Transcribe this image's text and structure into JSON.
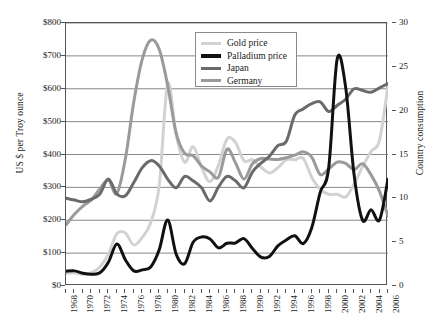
{
  "chart_data": {
    "type": "line",
    "title": "",
    "xlabel": "",
    "ylabel": "US $ per Troy ounce",
    "y2label": "Country consumption",
    "xlim": [
      1968,
      2006
    ],
    "ylim": [
      0,
      800
    ],
    "y2lim": [
      0,
      30
    ],
    "grid": true,
    "legend_position": "top-center",
    "xtick_labels": [
      "1968",
      "1970",
      "1972",
      "1974",
      "1976",
      "1978",
      "1980",
      "1982",
      "1984",
      "1986",
      "1988",
      "1990",
      "1992",
      "1994",
      "1996",
      "1998",
      "2000",
      "2002",
      "2004",
      "2006"
    ],
    "xtick_values": [
      1968,
      1970,
      1972,
      1974,
      1976,
      1978,
      1980,
      1982,
      1984,
      1986,
      1988,
      1990,
      1992,
      1994,
      1996,
      1998,
      2000,
      2002,
      2004,
      2006
    ],
    "ytick_labels": [
      "$0",
      "$100",
      "$200",
      "$300",
      "$400",
      "$500",
      "$600",
      "$700",
      "$800"
    ],
    "ytick_values": [
      0,
      100,
      200,
      300,
      400,
      500,
      600,
      700,
      800
    ],
    "y2tick_labels": [
      "0",
      "5",
      "10",
      "15",
      "20",
      "25",
      "30"
    ],
    "y2tick_values": [
      0,
      5,
      10,
      15,
      20,
      25,
      30
    ],
    "x": [
      1968,
      1969,
      1970,
      1971,
      1972,
      1973,
      1974,
      1975,
      1976,
      1977,
      1978,
      1979,
      1980,
      1981,
      1982,
      1983,
      1984,
      1985,
      1986,
      1987,
      1988,
      1989,
      1990,
      1991,
      1992,
      1993,
      1994,
      1995,
      1996,
      1997,
      1998,
      1999,
      2000,
      2001,
      2002,
      2003,
      2004,
      2005,
      2006
    ],
    "series": [
      {
        "name": "Gold price",
        "axis": "left",
        "unit": "US $ per Troy ounce",
        "color": "#d2d2d2",
        "width": 3.0,
        "values": [
          38,
          40,
          36,
          41,
          58,
          97,
          159,
          161,
          125,
          148,
          193,
          306,
          615,
          460,
          376,
          424,
          361,
          317,
          368,
          447,
          437,
          381,
          384,
          362,
          344,
          360,
          384,
          384,
          388,
          331,
          294,
          279,
          279,
          271,
          310,
          363,
          409,
          444,
          610
        ]
      },
      {
        "name": "Palladium price",
        "axis": "left",
        "unit": "US $ per Troy ounce",
        "color": "#111111",
        "width": 3.0,
        "values": [
          45,
          46,
          39,
          36,
          40,
          72,
          128,
          80,
          46,
          49,
          58,
          110,
          201,
          97,
          68,
          133,
          149,
          143,
          116,
          130,
          131,
          144,
          114,
          88,
          90,
          122,
          140,
          153,
          129,
          177,
          285,
          359,
          690,
          605,
          338,
          200,
          232,
          201,
          325
        ]
      },
      {
        "name": "Japan",
        "axis": "right",
        "unit": "Country consumption",
        "color": "#6a6a6a",
        "width": 3.0,
        "values": [
          10.0,
          9.8,
          9.6,
          9.9,
          10.5,
          12.2,
          10.5,
          10.3,
          11.8,
          13.5,
          14.3,
          13.7,
          12.2,
          11.2,
          12.5,
          12.0,
          11.2,
          9.7,
          11.3,
          12.5,
          12.0,
          11.2,
          13.0,
          14.0,
          14.8,
          16.0,
          16.5,
          19.5,
          20.2,
          20.8,
          21.0,
          19.9,
          20.6,
          21.3,
          22.5,
          22.3,
          22.1,
          22.6,
          23.1
        ]
      },
      {
        "name": "Germany",
        "axis": "left",
        "unit": "US $ per Troy ounce",
        "color": "#9a9a9a",
        "width": 3.0,
        "values": [
          186,
          218,
          243,
          262,
          296,
          322,
          281,
          386,
          560,
          690,
          748,
          720,
          610,
          465,
          404,
          396,
          365,
          347,
          331,
          416,
          375,
          325,
          372,
          388,
          386,
          385,
          390,
          398,
          408,
          392,
          339,
          356,
          377,
          373,
          354,
          372,
          338,
          288,
          212
        ]
      }
    ],
    "annotations": []
  },
  "legend": {
    "entries": [
      {
        "label": "Gold price"
      },
      {
        "label": "Palladium price"
      },
      {
        "label": "Japan"
      },
      {
        "label": "Germany"
      }
    ]
  }
}
